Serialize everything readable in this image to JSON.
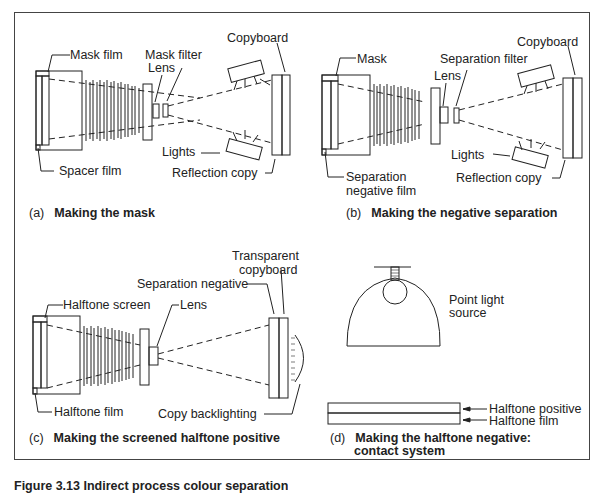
{
  "panels": {
    "a": {
      "letter": "(a)",
      "caption": "Making the mask",
      "labels": {
        "mask_film": "Mask film",
        "spacer_film": "Spacer film",
        "lens": "Lens",
        "mask_filter": "Mask filter",
        "copyboard": "Copyboard",
        "lights": "Lights",
        "reflection_copy": "Reflection copy"
      }
    },
    "b": {
      "letter": "(b)",
      "caption": "Making the negative separation",
      "labels": {
        "mask": "Mask",
        "separation_negative_film_1": "Separation",
        "separation_negative_film_2": "negative film",
        "lens": "Lens",
        "separation_filter": "Separation filter",
        "copyboard": "Copyboard",
        "lights": "Lights",
        "reflection_copy": "Reflection copy"
      }
    },
    "c": {
      "letter": "(c)",
      "caption": "Making the screened halftone positive",
      "labels": {
        "halftone_screen": "Halftone screen",
        "halftone_film": "Halftone film",
        "lens": "Lens",
        "separation_negative": "Separation negative",
        "transparent_copyboard_1": "Transparent",
        "transparent_copyboard_2": "copyboard",
        "copy_backlighting": "Copy backlighting"
      }
    },
    "d": {
      "letter": "(d)",
      "caption_line1": "Making the halftone negative:",
      "caption_line2": "contact system",
      "labels": {
        "point_light_1": "Point light",
        "point_light_2": "source",
        "halftone_positive": "Halftone positive",
        "halftone_film": "Halftone film"
      }
    }
  },
  "figure_caption": "Figure 3.13  Indirect process colour separation"
}
